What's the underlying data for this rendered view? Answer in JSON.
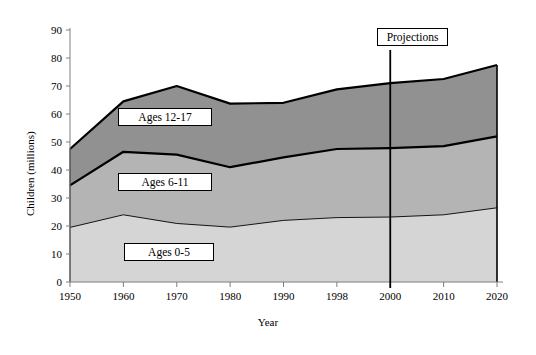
{
  "chart_data": {
    "type": "area",
    "stacked": true,
    "title": "",
    "subtitle": "",
    "xlabel": "Year",
    "ylabel": "Children (millions)",
    "categories": [
      "1950",
      "1960",
      "1970",
      "1980",
      "1990",
      "1998",
      "2000",
      "2010",
      "2020"
    ],
    "x": [
      1950,
      1960,
      1970,
      1980,
      1990,
      1998,
      2000,
      2010,
      2020
    ],
    "ylim": [
      0,
      90
    ],
    "y_ticks": [
      0,
      10,
      20,
      30,
      40,
      50,
      60,
      70,
      80,
      90
    ],
    "y_tick_labels": [
      "0",
      "10",
      "20",
      "30",
      "40",
      "50",
      "60",
      "70",
      "80",
      "90"
    ],
    "grid": false,
    "legend_position": "inline-boxes",
    "series": [
      {
        "name": "Ages 0-5",
        "color": "#d5d5d5",
        "values": [
          19.5,
          24.0,
          20.9,
          19.6,
          22.0,
          23.0,
          23.2,
          24.0,
          26.5
        ]
      },
      {
        "name": "Ages 6-11",
        "color": "#b4b4b4",
        "values": [
          15.0,
          22.5,
          24.6,
          21.4,
          22.5,
          24.5,
          24.6,
          24.5,
          25.5
        ]
      },
      {
        "name": "Ages 12-17",
        "color": "#919191",
        "values": [
          13.0,
          18.0,
          24.5,
          22.7,
          19.5,
          21.3,
          23.2,
          24.0,
          25.5
        ]
      }
    ],
    "cumulative": {
      "ages_0_5": [
        19.5,
        24.0,
        20.9,
        19.6,
        22.0,
        23.0,
        23.2,
        24.0,
        26.5
      ],
      "through_ages_6_11": [
        34.5,
        46.5,
        45.5,
        41.0,
        44.5,
        47.5,
        47.8,
        48.5,
        52.0
      ],
      "total": [
        47.5,
        64.5,
        70.0,
        63.7,
        64.0,
        68.8,
        71.0,
        72.5,
        77.5
      ]
    },
    "annotations": [
      {
        "name": "projections-divider",
        "label": "Projections",
        "at_x": "2000",
        "type": "vertical-line"
      }
    ]
  },
  "labels": {
    "ages_12_17": "Ages 12-17",
    "ages_6_11": "Ages 6-11",
    "ages_0_5": "Ages 0-5",
    "projections": "Projections"
  },
  "axes": {
    "y_title": "Children (millions)",
    "x_title": "Year"
  },
  "colors": {
    "band_ages_12_17": "#919191",
    "band_ages_6_11": "#b4b4b4",
    "band_ages_0_5": "#d5d5d5",
    "outline": "#000000",
    "axis": "#7f7f7f",
    "background": "#ffffff"
  }
}
